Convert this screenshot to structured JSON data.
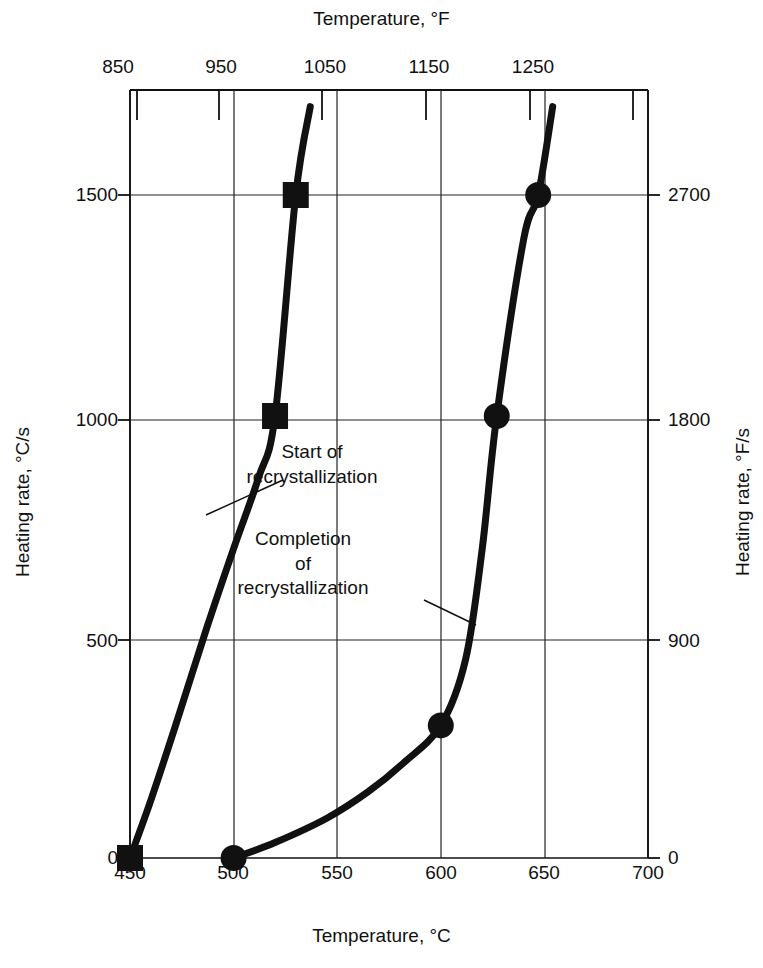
{
  "chart_data": {
    "type": "line",
    "title": "",
    "xlabel": "Temperature, °C",
    "ylabel": "Heating rate, °C/s",
    "x2label": "Temperature, °F",
    "y2label": "Heating rate, °F/s",
    "xlim": [
      450,
      700
    ],
    "ylim": [
      0,
      1700
    ],
    "x2lim": [
      842,
      1292
    ],
    "y2lim": [
      0,
      3060
    ],
    "grid": true,
    "legend_position": "none",
    "xticks": [
      450,
      500,
      550,
      600,
      650,
      700
    ],
    "xticklabels": [
      "450",
      "500",
      "550",
      "600",
      "650",
      "700"
    ],
    "yticks": [
      0,
      500,
      1000,
      1500
    ],
    "yticklabels": [
      "0",
      "500",
      "1000",
      "1500"
    ],
    "x2ticks": [
      850,
      950,
      1050,
      1150,
      1250
    ],
    "x2ticklabels": [
      "850",
      "950",
      "1050",
      "1150",
      "1250"
    ],
    "y2ticks": [
      0,
      900,
      1800,
      2700
    ],
    "y2ticklabels": [
      "0",
      "900",
      "1800",
      "2700"
    ],
    "series": [
      {
        "name": "Start of recrystallization",
        "marker": "square",
        "points": [
          {
            "x": 450,
            "y": 0
          },
          {
            "x": 460,
            "y": 130
          },
          {
            "x": 472,
            "y": 300
          },
          {
            "x": 487,
            "y": 520
          },
          {
            "x": 500,
            "y": 700
          },
          {
            "x": 512,
            "y": 860
          },
          {
            "x": 520,
            "y": 1000
          },
          {
            "x": 530,
            "y": 1500
          },
          {
            "x": 537,
            "y": 1700
          }
        ],
        "markers": [
          {
            "x": 450,
            "y": 0
          },
          {
            "x": 520,
            "y": 1000
          },
          {
            "x": 530,
            "y": 1500
          }
        ]
      },
      {
        "name": "Completion of recrystallization",
        "marker": "circle",
        "points": [
          {
            "x": 500,
            "y": 0
          },
          {
            "x": 520,
            "y": 35
          },
          {
            "x": 545,
            "y": 90
          },
          {
            "x": 565,
            "y": 150
          },
          {
            "x": 582,
            "y": 215
          },
          {
            "x": 600,
            "y": 300
          },
          {
            "x": 612,
            "y": 450
          },
          {
            "x": 620,
            "y": 700
          },
          {
            "x": 627,
            "y": 1000
          },
          {
            "x": 640,
            "y": 1400
          },
          {
            "x": 647,
            "y": 1500
          },
          {
            "x": 654,
            "y": 1700
          }
        ],
        "markers": [
          {
            "x": 500,
            "y": 0
          },
          {
            "x": 600,
            "y": 300
          },
          {
            "x": 627,
            "y": 1000
          },
          {
            "x": 647,
            "y": 1500
          }
        ]
      }
    ],
    "annotations": [
      {
        "id": "start",
        "text": "Start of\nrecrystallization",
        "leader_from": {
          "x": 479,
          "y": 790
        },
        "leader_to": {
          "x": 508,
          "y": 960
        }
      },
      {
        "id": "completion",
        "text": "Completion\nof\nrecrystallization",
        "leader_from": {
          "x": 618,
          "y": 410
        },
        "leader_to": {
          "x": 588,
          "y": 330
        }
      }
    ],
    "colors": {
      "background": "#ffffff",
      "axis": "#111111",
      "grid": "#222222",
      "curve": "#111111",
      "marker": "#111111"
    }
  },
  "axes": {
    "top_title": "Temperature, °F",
    "bottom_title": "Temperature, °C",
    "left_title": "Heating rate, °C/s",
    "right_title": "Heating rate, °F/s"
  },
  "annotations": {
    "start": "Start of\nrecrystallization",
    "completion": "Completion\nof\nrecrystallization"
  },
  "ticks": {
    "top": [
      "850",
      "950",
      "1050",
      "1150",
      "1250"
    ],
    "bottom": [
      "450",
      "500",
      "550",
      "600",
      "650",
      "700"
    ],
    "left": [
      "1500",
      "1000",
      "500",
      "0"
    ],
    "right": [
      "2700",
      "1800",
      "900",
      "0"
    ]
  }
}
